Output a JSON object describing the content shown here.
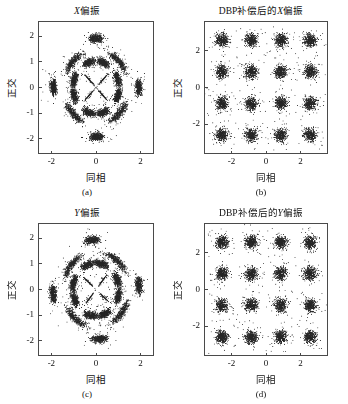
{
  "figure": {
    "width": 348,
    "height": 404,
    "background": "#ffffff",
    "point_color": "#262626"
  },
  "panels": [
    {
      "id": "a",
      "title_prefix": "",
      "title_italic": "X",
      "title_suffix": "偏振",
      "title_full": "X偏振",
      "caption": "(a)",
      "xlabel": "同相",
      "ylabel": "正交",
      "xticks": [
        "-2",
        "0",
        "2"
      ],
      "xtick_values": [
        -2,
        0,
        2
      ],
      "yticks": [
        "2",
        "1",
        "0",
        "-1",
        "-2"
      ],
      "ytick_values": [
        2,
        1,
        0,
        -1,
        -2
      ],
      "xlim": [
        -2.6,
        2.6
      ],
      "ylim": [
        -2.6,
        2.6
      ]
    },
    {
      "id": "b",
      "title_prefix": "DBP补偿后的",
      "title_italic": "X",
      "title_suffix": "偏振",
      "title_full": "DBP补偿后的X偏振",
      "caption": "(b)",
      "xlabel": "同相",
      "ylabel": "正交",
      "xticks": [
        "-2",
        "0",
        "2"
      ],
      "xtick_values": [
        -2,
        0,
        2
      ],
      "yticks": [
        "2",
        "0",
        "-2"
      ],
      "ytick_values": [
        2,
        0,
        -2
      ],
      "xlim": [
        -3.6,
        3.6
      ],
      "ylim": [
        -3.6,
        3.6
      ]
    },
    {
      "id": "c",
      "title_prefix": "",
      "title_italic": "Y",
      "title_suffix": "偏振",
      "title_full": "Y偏振",
      "caption": "(c)",
      "xlabel": "同相",
      "ylabel": "正交",
      "xticks": [
        "-2",
        "0",
        "2"
      ],
      "xtick_values": [
        -2,
        0,
        2
      ],
      "yticks": [
        "2",
        "1",
        "0",
        "-1",
        "-2"
      ],
      "ytick_values": [
        2,
        1,
        0,
        -1,
        -2
      ],
      "xlim": [
        -2.6,
        2.6
      ],
      "ylim": [
        -2.6,
        2.6
      ]
    },
    {
      "id": "d",
      "title_prefix": "DBP补偿后的",
      "title_italic": "Y",
      "title_suffix": "偏振",
      "title_full": "DBP补偿后的Y偏振",
      "caption": "(d)",
      "xlabel": "同相",
      "ylabel": "正交",
      "xticks": [
        "-2",
        "0",
        "2"
      ],
      "xtick_values": [
        -2,
        0,
        2
      ],
      "yticks": [
        "2",
        "0",
        "-2"
      ],
      "ytick_values": [
        2,
        0,
        -2
      ],
      "xlim": [
        -3.6,
        3.6
      ],
      "ylim": [
        -3.6,
        3.6
      ]
    }
  ],
  "chart_data": [
    {
      "type": "scatter",
      "panel": "a",
      "title": "X偏振",
      "xlabel": "同相",
      "ylabel": "正交",
      "xlim": [
        -2.6,
        2.6
      ],
      "ylim": [
        -2.6,
        2.6
      ],
      "xticks": [
        -2,
        0,
        2
      ],
      "yticks": [
        -2,
        -1,
        0,
        1,
        2
      ],
      "grid": false,
      "legend": "none",
      "modulation": "16-QAM",
      "description": "Received X-polarization constellation before DBP compensation; nonlinear phase noise rotates outer symbol clusters into arcs, forming a ring pattern with 4 compact inner clusters.",
      "ideal_cluster_radii": [
        0.45,
        1.0,
        1.42
      ],
      "clusters": [
        {
          "r": 0.46,
          "theta_deg": 45,
          "spread": 0.17,
          "arc_deg": 0,
          "n": 420
        },
        {
          "r": 0.46,
          "theta_deg": 135,
          "spread": 0.17,
          "arc_deg": 0,
          "n": 420
        },
        {
          "r": 0.46,
          "theta_deg": 225,
          "spread": 0.17,
          "arc_deg": 0,
          "n": 420
        },
        {
          "r": 0.46,
          "theta_deg": 315,
          "spread": 0.17,
          "arc_deg": 0,
          "n": 420
        },
        {
          "r": 1.05,
          "theta_deg": 18,
          "spread": 0.13,
          "arc_deg": 22,
          "n": 420
        },
        {
          "r": 1.05,
          "theta_deg": 72,
          "spread": 0.13,
          "arc_deg": 22,
          "n": 420
        },
        {
          "r": 1.05,
          "theta_deg": 108,
          "spread": 0.13,
          "arc_deg": 22,
          "n": 420
        },
        {
          "r": 1.05,
          "theta_deg": 162,
          "spread": 0.13,
          "arc_deg": 22,
          "n": 420
        },
        {
          "r": 1.05,
          "theta_deg": 198,
          "spread": 0.13,
          "arc_deg": 22,
          "n": 420
        },
        {
          "r": 1.05,
          "theta_deg": 252,
          "spread": 0.13,
          "arc_deg": 22,
          "n": 420
        },
        {
          "r": 1.05,
          "theta_deg": 288,
          "spread": 0.13,
          "arc_deg": 22,
          "n": 420
        },
        {
          "r": 1.05,
          "theta_deg": 342,
          "spread": 0.13,
          "arc_deg": 22,
          "n": 420
        },
        {
          "r": 1.48,
          "theta_deg": 45,
          "spread": 0.13,
          "arc_deg": 30,
          "n": 430
        },
        {
          "r": 1.48,
          "theta_deg": 135,
          "spread": 0.13,
          "arc_deg": 30,
          "n": 430
        },
        {
          "r": 1.48,
          "theta_deg": 225,
          "spread": 0.13,
          "arc_deg": 30,
          "n": 430
        },
        {
          "r": 1.48,
          "theta_deg": 315,
          "spread": 0.13,
          "arc_deg": 30,
          "n": 430
        },
        {
          "r": 1.95,
          "theta_deg": 0,
          "spread": 0.14,
          "arc_deg": 13,
          "n": 430
        },
        {
          "r": 1.95,
          "theta_deg": 90,
          "spread": 0.14,
          "arc_deg": 13,
          "n": 430
        },
        {
          "r": 1.95,
          "theta_deg": 180,
          "spread": 0.14,
          "arc_deg": 13,
          "n": 430
        },
        {
          "r": 1.95,
          "theta_deg": 270,
          "spread": 0.14,
          "arc_deg": 13,
          "n": 430
        }
      ]
    },
    {
      "type": "scatter",
      "panel": "b",
      "title": "DBP补偿后的X偏振",
      "xlabel": "同相",
      "ylabel": "正交",
      "xlim": [
        -3.6,
        3.6
      ],
      "ylim": [
        -3.6,
        3.6
      ],
      "xticks": [
        -2,
        0,
        2
      ],
      "yticks": [
        -2,
        0,
        2
      ],
      "grid": false,
      "legend": "none",
      "modulation": "16-QAM",
      "description": "X-polarization constellation after DBP compensation; 16 well-separated Gaussian clusters on a 4x4 rectangular grid.",
      "grid_levels": [
        -2.6,
        -0.87,
        0.87,
        2.6
      ],
      "cluster_spread": 0.32,
      "points_per_cluster": 380
    },
    {
      "type": "scatter",
      "panel": "c",
      "title": "Y偏振",
      "xlabel": "同相",
      "ylabel": "正交",
      "xlim": [
        -2.6,
        2.6
      ],
      "ylim": [
        -2.6,
        2.6
      ],
      "xticks": [
        -2,
        0,
        2
      ],
      "yticks": [
        -2,
        -1,
        0,
        1,
        2
      ],
      "grid": false,
      "legend": "none",
      "modulation": "16-QAM",
      "description": "Received Y-polarization constellation before DBP compensation; same ring-smeared structure as panel (a).",
      "ideal_cluster_radii": [
        0.45,
        1.0,
        1.42
      ],
      "clusters": [
        {
          "r": 0.47,
          "theta_deg": 50,
          "spread": 0.17,
          "arc_deg": 0,
          "n": 420
        },
        {
          "r": 0.47,
          "theta_deg": 140,
          "spread": 0.17,
          "arc_deg": 0,
          "n": 420
        },
        {
          "r": 0.47,
          "theta_deg": 230,
          "spread": 0.17,
          "arc_deg": 0,
          "n": 420
        },
        {
          "r": 0.47,
          "theta_deg": 320,
          "spread": 0.17,
          "arc_deg": 0,
          "n": 420
        },
        {
          "r": 1.06,
          "theta_deg": 22,
          "spread": 0.13,
          "arc_deg": 24,
          "n": 420
        },
        {
          "r": 1.06,
          "theta_deg": 76,
          "spread": 0.13,
          "arc_deg": 24,
          "n": 420
        },
        {
          "r": 1.06,
          "theta_deg": 112,
          "spread": 0.13,
          "arc_deg": 24,
          "n": 420
        },
        {
          "r": 1.06,
          "theta_deg": 166,
          "spread": 0.13,
          "arc_deg": 24,
          "n": 420
        },
        {
          "r": 1.06,
          "theta_deg": 202,
          "spread": 0.13,
          "arc_deg": 24,
          "n": 420
        },
        {
          "r": 1.06,
          "theta_deg": 256,
          "spread": 0.13,
          "arc_deg": 24,
          "n": 420
        },
        {
          "r": 1.06,
          "theta_deg": 292,
          "spread": 0.13,
          "arc_deg": 24,
          "n": 420
        },
        {
          "r": 1.06,
          "theta_deg": 346,
          "spread": 0.13,
          "arc_deg": 24,
          "n": 420
        },
        {
          "r": 1.5,
          "theta_deg": 50,
          "spread": 0.13,
          "arc_deg": 32,
          "n": 430
        },
        {
          "r": 1.5,
          "theta_deg": 140,
          "spread": 0.13,
          "arc_deg": 32,
          "n": 430
        },
        {
          "r": 1.5,
          "theta_deg": 230,
          "spread": 0.13,
          "arc_deg": 32,
          "n": 430
        },
        {
          "r": 1.5,
          "theta_deg": 320,
          "spread": 0.13,
          "arc_deg": 32,
          "n": 430
        },
        {
          "r": 1.97,
          "theta_deg": 5,
          "spread": 0.14,
          "arc_deg": 14,
          "n": 430
        },
        {
          "r": 1.97,
          "theta_deg": 95,
          "spread": 0.14,
          "arc_deg": 14,
          "n": 430
        },
        {
          "r": 1.97,
          "theta_deg": 185,
          "spread": 0.14,
          "arc_deg": 14,
          "n": 430
        },
        {
          "r": 1.97,
          "theta_deg": 275,
          "spread": 0.14,
          "arc_deg": 14,
          "n": 430
        }
      ]
    },
    {
      "type": "scatter",
      "panel": "d",
      "title": "DBP补偿后的Y偏振",
      "xlabel": "同相",
      "ylabel": "正交",
      "xlim": [
        -3.6,
        3.6
      ],
      "ylim": [
        -3.6,
        3.6
      ],
      "xticks": [
        -2,
        0,
        2
      ],
      "yticks": [
        -2,
        0,
        2
      ],
      "grid": false,
      "legend": "none",
      "modulation": "16-QAM",
      "description": "Y-polarization constellation after DBP compensation; 16 well-separated Gaussian clusters on a 4x4 rectangular grid.",
      "grid_levels": [
        -2.6,
        -0.87,
        0.87,
        2.6
      ],
      "cluster_spread": 0.32,
      "points_per_cluster": 380
    }
  ]
}
